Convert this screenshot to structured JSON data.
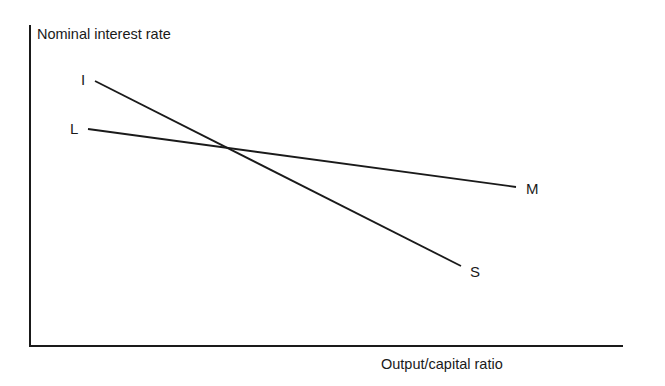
{
  "diagram": {
    "y_axis_label": "Nominal interest rate",
    "x_axis_label": "Output/capital ratio",
    "curves": [
      {
        "id": "IS",
        "start_label": "I",
        "end_label": "S",
        "slope": "steep negative"
      },
      {
        "id": "LM",
        "start_label": "L",
        "end_label": "M",
        "slope": "shallow negative"
      }
    ],
    "line_color": "#1a1a1a"
  }
}
